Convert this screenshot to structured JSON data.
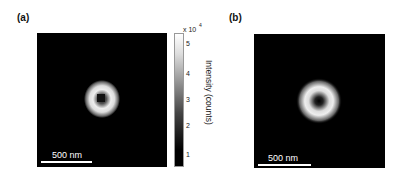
{
  "panels": [
    {
      "label": "(a)",
      "description": "pixelated donut-shaped intensity image",
      "scalebar": "500 nm"
    },
    {
      "label": "(b)",
      "description": "smooth donut-shaped simulated intensity image",
      "scalebar": "500 nm"
    }
  ],
  "colorbar": {
    "multiplier": "x 10",
    "exponent": "4",
    "ticks": [
      "5",
      "4",
      "3",
      "2",
      "1"
    ],
    "label": "Intensity (counts)",
    "colormap": "gray"
  }
}
